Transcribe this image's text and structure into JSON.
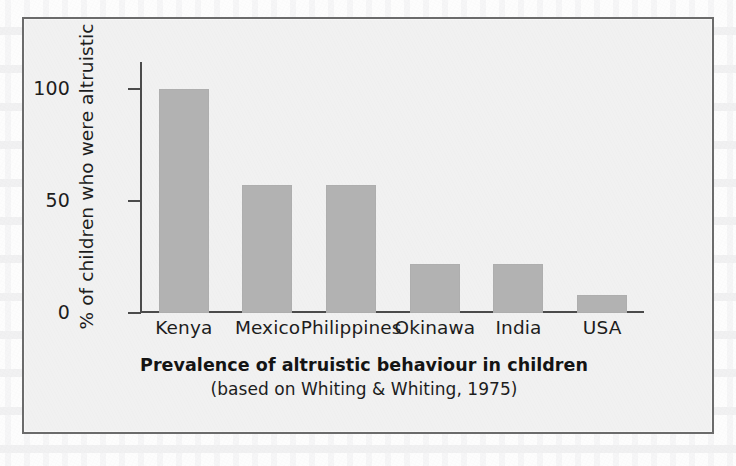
{
  "figure": {
    "caption_title": "Prevalence of altruistic behaviour in children",
    "caption_source": "(based on Whiting & Whiting, 1975)",
    "frame_border_color": "#6b6b6b",
    "panel_background_color": "#f1f1f1",
    "page_background_color": "#fdfdfd"
  },
  "chart_data": {
    "type": "bar",
    "title": "Prevalence of altruistic behaviour in children",
    "subtitle": "(based on Whiting & Whiting, 1975)",
    "xlabel": "",
    "ylabel": "% of children who were altruistic",
    "categories": [
      "Kenya",
      "Mexico",
      "Philippines",
      "Okinawa",
      "India",
      "USA"
    ],
    "values": [
      100,
      57,
      57,
      22,
      22,
      8
    ],
    "ylim": [
      0,
      112
    ],
    "yticks": [
      0,
      50,
      100
    ],
    "ytick_labels": [
      "0",
      "50",
      "100"
    ],
    "grid": false,
    "legend": false,
    "bar_color": "#b2b2b2",
    "axis_color": "#4b4b4b",
    "text_color": "#1d1d1d"
  }
}
